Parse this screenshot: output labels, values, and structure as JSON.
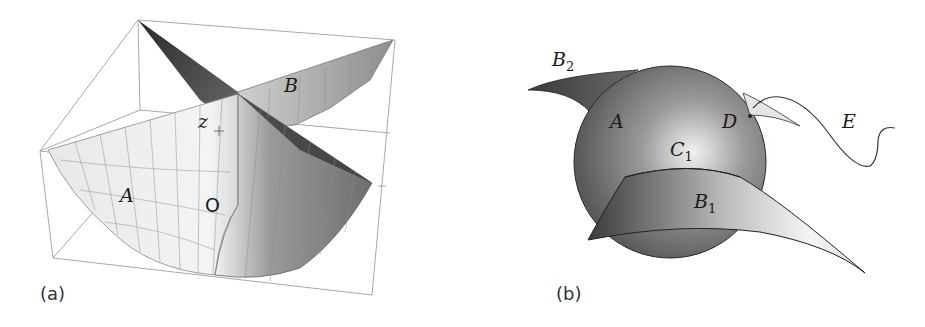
{
  "figure": {
    "panels": [
      {
        "id": "a",
        "caption": "(a)",
        "labels": {
          "A": "A",
          "B": "B",
          "z": "z",
          "O": "O"
        }
      },
      {
        "id": "b",
        "caption": "(b)",
        "labels": {
          "B2_base": "B",
          "B2_sub": "2",
          "A": "A",
          "D": "D",
          "E": "E",
          "C1_base": "C",
          "C1_sub": "1",
          "B1_base": "B",
          "B1_sub": "1"
        }
      }
    ],
    "colors": {
      "box_line": "#9a9a9a",
      "surface_light": "#e6e6e6",
      "surface_dark": "#3a3a3a",
      "sphere_mid": "#8a8a8a",
      "outline": "#222222"
    }
  }
}
